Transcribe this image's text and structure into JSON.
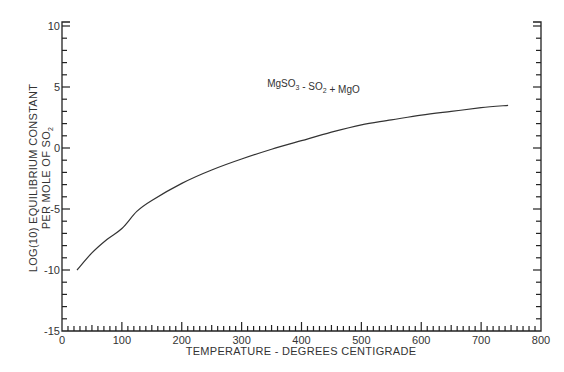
{
  "chart_data": {
    "type": "line",
    "title": "",
    "annotation": {
      "parts": [
        {
          "text": "MgSO",
          "sub": "3"
        },
        {
          "text": " - SO",
          "sub": "2"
        },
        {
          "text": " + MgO",
          "sub": ""
        }
      ],
      "plain": "MgSO3 - SO2 + MgO",
      "x": 420,
      "y": 5
    },
    "xlabel": "TEMPERATURE - DEGREES CENTIGRADE",
    "ylabel_line1": "LOG(10) EQUILIBRIUM CONSTANT",
    "ylabel_line2_text": "PER MOLE OF SO",
    "ylabel_line2_sub": "2",
    "xlim": [
      0,
      800
    ],
    "ylim": [
      -15,
      10
    ],
    "x_ticks": [
      0,
      100,
      200,
      300,
      400,
      500,
      600,
      700,
      800
    ],
    "x_tick_labels": [
      "0",
      "100",
      "200",
      "300",
      "400",
      "500",
      "600",
      "700",
      "800"
    ],
    "x_minor_step": 10,
    "y_ticks": [
      10,
      5,
      0,
      -5,
      -10,
      -15
    ],
    "y_tick_labels": [
      "10",
      "5",
      "0",
      "-5",
      "-10",
      "-15"
    ],
    "y_minor_step": 1,
    "grid": false,
    "legend": null,
    "series": [
      {
        "name": "MgSO3 - SO2 + MgO",
        "x": [
          25,
          50,
          75,
          100,
          125,
          150,
          200,
          250,
          300,
          350,
          400,
          450,
          500,
          550,
          600,
          650,
          700,
          745
        ],
        "y": [
          -10.0,
          -8.6,
          -7.5,
          -6.6,
          -5.2,
          -4.3,
          -2.9,
          -1.8,
          -0.9,
          -0.1,
          0.6,
          1.3,
          1.9,
          2.3,
          2.7,
          3.0,
          3.3,
          3.5
        ]
      }
    ]
  }
}
